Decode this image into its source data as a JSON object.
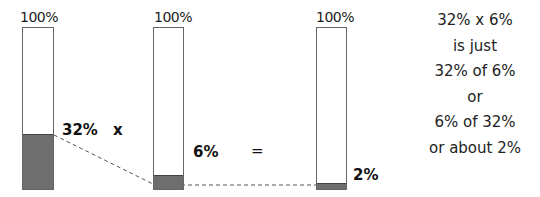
{
  "bars": [
    {
      "top_label": "100%",
      "value_label": "32%",
      "fill_percent": 32
    },
    {
      "top_label": "100%",
      "value_label": "6%",
      "fill_percent": 6
    },
    {
      "top_label": "100%",
      "value_label": "2%",
      "fill_percent": 2
    }
  ],
  "operators": {
    "multiply": "x",
    "equals": "="
  },
  "explanation": {
    "lines": [
      "32% x 6%",
      "is just",
      "32% of 6%",
      "or",
      "6% of 32%",
      "or about 2%"
    ]
  },
  "colors": {
    "fill": "#6e6e6e",
    "outline": "#666666",
    "dash": "#555555"
  }
}
